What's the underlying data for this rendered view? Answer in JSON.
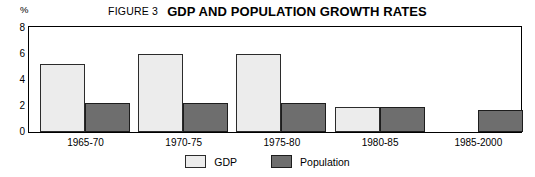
{
  "header": {
    "figure_number": "FIGURE 3",
    "title": "GDP AND POPULATION GROWTH RATES"
  },
  "legend": {
    "position": "bottom-center",
    "items": [
      {
        "label": "GDP",
        "color": "#ececec",
        "swatch_name": "legend-swatch-gdp"
      },
      {
        "label": "Population",
        "color": "#6e6e6e",
        "swatch_name": "legend-swatch-population"
      }
    ]
  },
  "axes": {
    "y_unit": "%",
    "y_ticks": [
      "0",
      "2",
      "4",
      "6",
      "8"
    ],
    "x_ticks": [
      "1965-70",
      "1970-75",
      "1975-80",
      "1980-85",
      "1985-2000"
    ]
  },
  "chart_data": {
    "type": "bar",
    "title": "GDP AND POPULATION GROWTH RATES",
    "subtitle": "FIGURE 3",
    "xlabel": "",
    "ylabel": "%",
    "ylim": [
      0,
      8
    ],
    "yticks": [
      0,
      2,
      4,
      6,
      8
    ],
    "grid": false,
    "legend": "bottom-center",
    "categories": [
      "1965-70",
      "1970-75",
      "1975-80",
      "1980-85",
      "1985-2000"
    ],
    "series": [
      {
        "name": "GDP",
        "color": "#ececec",
        "values": [
          5.2,
          6.0,
          6.0,
          1.9,
          null
        ]
      },
      {
        "name": "Population",
        "color": "#6e6e6e",
        "values": [
          2.2,
          2.2,
          2.2,
          1.9,
          1.7
        ]
      }
    ]
  }
}
